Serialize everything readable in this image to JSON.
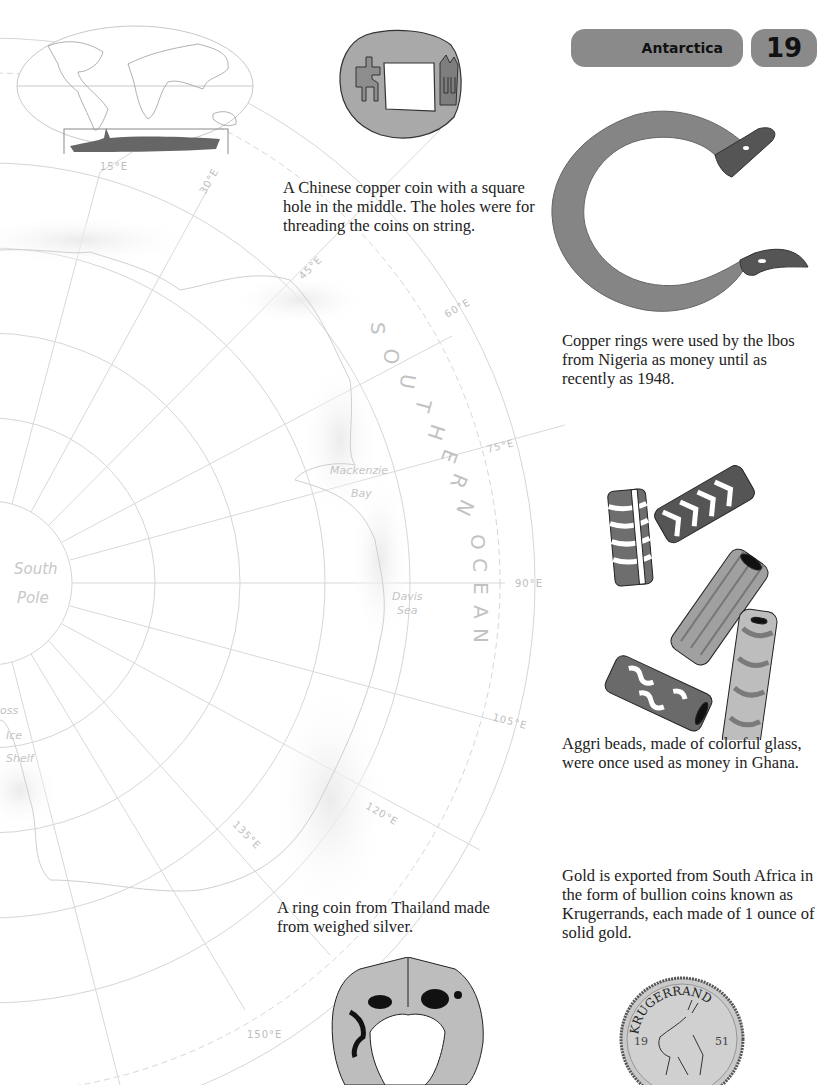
{
  "header": {
    "title": "Antarctica",
    "page_number": "19",
    "pill_color": "#8a8a8a"
  },
  "locator_map": {
    "description": "World map with Antarctica highlighted in box"
  },
  "map": {
    "longitude_labels": [
      "15°E",
      "30°E",
      "45°E",
      "60°E",
      "75°E",
      "90°E",
      "105°E",
      "120°E",
      "135°E",
      "150°E"
    ],
    "pole_label_line1": "South",
    "pole_label_line2": "Pole",
    "ocean_letters": [
      "S",
      "O",
      "U",
      "T",
      "H",
      "E",
      "R",
      "N",
      "O",
      "C",
      "E",
      "A",
      "N"
    ],
    "places": {
      "mackenzie": "Mackenzie",
      "bay": "Bay",
      "davis": "Davis",
      "sea": "Sea",
      "ross": "oss",
      "ice": "Ice",
      "shelf": "Shelf"
    },
    "line_color": "#d4d4d4"
  },
  "captions": {
    "chinese_coin": "A Chinese copper coin with a square hole in the middle. The holes were for threading the coins on string.",
    "copper_rings": "Copper rings were used by the lbos from Nigeria as money until as recently as 1948.",
    "aggri_beads": "Aggri beads, made of colorful glass, were once used as money in Ghana.",
    "thai_ring": "A ring coin from Thailand made from weighed silver.",
    "krugerrand": "Gold is exported from South Africa in the form of bullion coins known as Krugerrands, each made of 1 ounce of solid gold."
  },
  "coin_text": {
    "krugerrand_top": "KRUGERRAND",
    "year_left": "19",
    "year_right": "51",
    "bottom": "FYNGOUD 1OZ FINE GOLD"
  }
}
